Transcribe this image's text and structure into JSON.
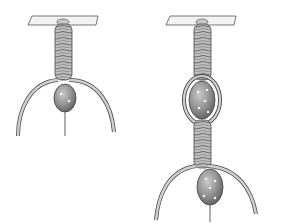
{
  "figure": {
    "colors": {
      "background": "#ffffff",
      "cord": "#b8b8b8",
      "cord_dark": "#6e6e6e",
      "bead": "#8f8f8f",
      "bead_highlight": "#d8d8d8",
      "bar": "#f2f2f2",
      "outline": "#4a4a4a"
    },
    "panels": [
      {
        "name": "step-1",
        "label": ""
      },
      {
        "name": "step-2",
        "label": ""
      }
    ]
  }
}
